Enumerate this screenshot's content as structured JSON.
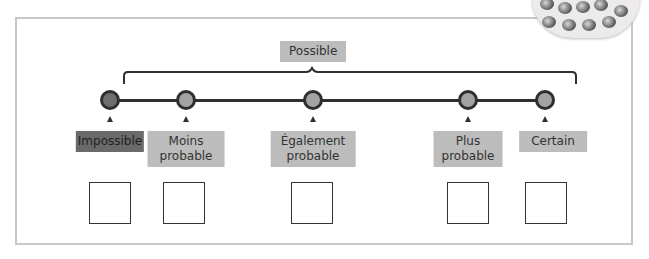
{
  "diagram": {
    "top_label": "Possible",
    "colors": {
      "line": "#2f2f2f",
      "label_bg": "#bcbcbc",
      "impossible_bg": "#6a6a6a",
      "frame": "#c8c8c8"
    },
    "points": [
      {
        "label": "Impossible",
        "x": 110,
        "dark": true
      },
      {
        "label": "Moins probable",
        "line1": "Moins",
        "line2": "probable",
        "x": 186
      },
      {
        "label": "Également probable",
        "line1": "Également",
        "line2": "probable",
        "x": 313
      },
      {
        "label": "Plus probable",
        "line1": "Plus",
        "line2": "probable",
        "x": 468
      },
      {
        "label": "Certain",
        "x": 545
      }
    ],
    "answer_boxes": [
      {
        "x": 110,
        "value": ""
      },
      {
        "x": 184,
        "value": ""
      },
      {
        "x": 312,
        "value": ""
      },
      {
        "x": 468,
        "value": ""
      },
      {
        "x": 546,
        "value": ""
      }
    ]
  }
}
